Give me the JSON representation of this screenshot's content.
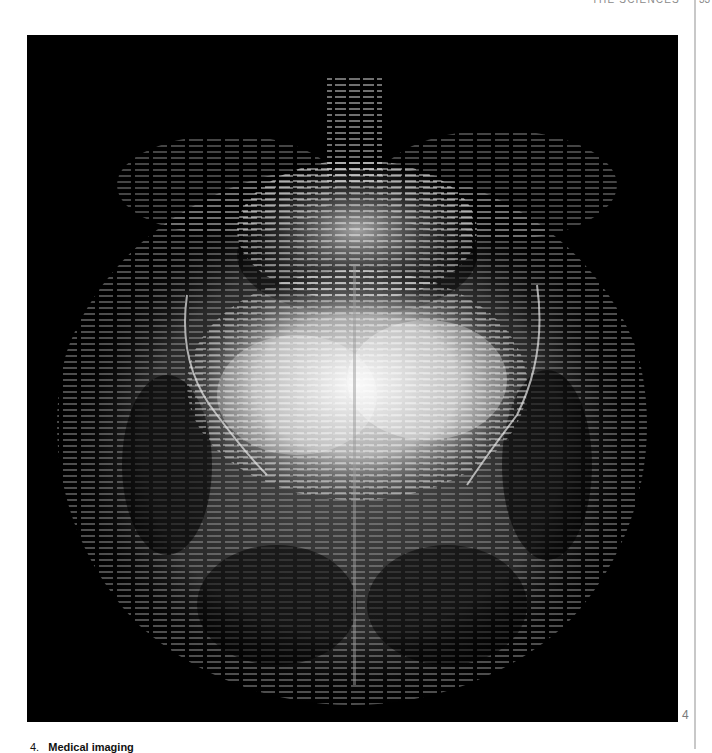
{
  "page": {
    "running_header": "THE SCIENCES",
    "folio": "33"
  },
  "figure": {
    "number": "4",
    "alt": "Medical imaging scan — grayscale streaked volumetric rendering of an organ cross-section on black background",
    "background_color": "#000000",
    "highlight_color": "#f2f2f2",
    "mid_tone_color": "#4a4a4a"
  },
  "caption": {
    "number": "4.",
    "title": "Medical imaging"
  }
}
